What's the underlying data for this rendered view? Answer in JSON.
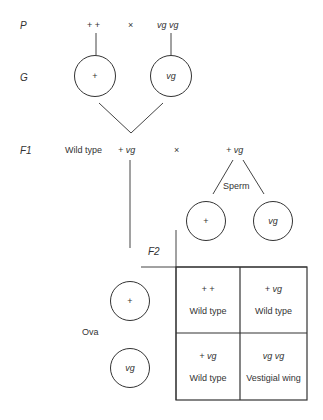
{
  "generations": {
    "p": "P",
    "g": "G",
    "f1": "F1",
    "f2": "F2"
  },
  "parents": {
    "left": "+ +",
    "cross": "×",
    "right": "vg vg"
  },
  "gametes": {
    "left": "+",
    "right": "vg"
  },
  "f1": {
    "label": "Wild type",
    "left_genotype": "+ vg",
    "cross": "×",
    "right_genotype": "+ vg"
  },
  "sperm": {
    "label": "Sperm",
    "left": "+",
    "right": "vg"
  },
  "ova": {
    "label": "Ova",
    "top": "+",
    "bottom": "vg"
  },
  "punnett": {
    "cells": [
      {
        "genotype": "+  +",
        "phenotype": "Wild type"
      },
      {
        "genotype": "+ vg",
        "phenotype": "Wild type"
      },
      {
        "genotype": "+ vg",
        "phenotype": "Wild type"
      },
      {
        "genotype": "vg vg",
        "phenotype": "Vestigial wing"
      }
    ]
  }
}
